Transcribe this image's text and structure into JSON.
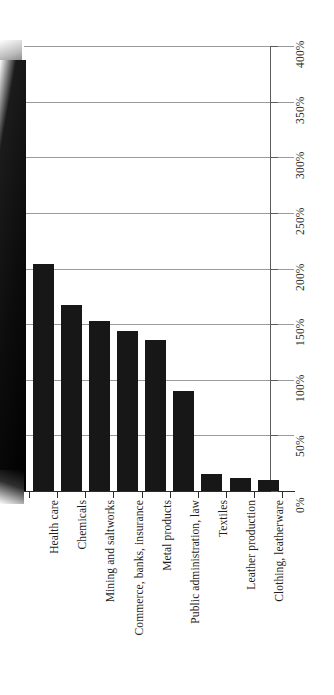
{
  "chart_data": {
    "type": "bar",
    "title": "",
    "subtitle": "",
    "xlabel": "",
    "ylabel": "",
    "orientation": "vertical",
    "rotated_render": true,
    "grid": true,
    "legend": null,
    "ylim": [
      0,
      400
    ],
    "ytick_step": 50,
    "ytick_labels": [
      "400%",
      "350%",
      "300%",
      "250%",
      "200%",
      "150%",
      "100%",
      "50%",
      "0%"
    ],
    "ytick_values": [
      400,
      350,
      300,
      250,
      200,
      150,
      100,
      50,
      0
    ],
    "categories": [
      "Health care",
      "Chemicals",
      "Mining and saltworks",
      "Commerce, banks, insurance",
      "Metal products",
      "Public administration, law",
      "Textiles",
      "Leather production",
      "Clothing, leatherware"
    ],
    "values": [
      204,
      167,
      153,
      144,
      136,
      90,
      15,
      12,
      10
    ],
    "clipped_leading_bar": {
      "present": true,
      "note": "tall bar cut off at left edge of image, extends above 400%"
    },
    "bar_color": "#171717",
    "gridline_color": "#9a9a9a",
    "axis_color": "#2b2b2b",
    "background_color": "#ffffff"
  }
}
